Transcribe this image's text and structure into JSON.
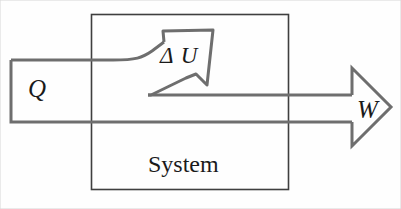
{
  "figure": {
    "kind": "thermodynamics-energy-flow-diagram",
    "width": 401,
    "height": 209,
    "background_color": "#fefefe"
  },
  "labels": {
    "heat_in": "Q",
    "internal_energy_change": "Δ U",
    "work_out": "W",
    "system_box": "System"
  },
  "colors": {
    "flow_stroke": "#6e6e6e",
    "box_stroke": "#3f3f3f",
    "text": "#1a1a1a",
    "background": "#fefefe"
  },
  "elements": {
    "system_box": {
      "name": "System",
      "x": 91,
      "y": 14,
      "width": 198,
      "height": 176,
      "stroke_width": 1.6
    },
    "heat_arrow": {
      "label": "Q",
      "direction": "into-system",
      "band_left_x": 10,
      "band_top_y": 60,
      "band_bottom_y": 122,
      "stroke_width": 3
    },
    "internal_energy_arrow": {
      "label": "Δ U",
      "direction": "up-right",
      "tip_x": 213,
      "tip_y": 30,
      "base_y": 95,
      "stroke_width": 3
    },
    "work_arrow": {
      "label": "W",
      "direction": "out-of-system",
      "shaft_top_y": 95,
      "shaft_bottom_y": 122,
      "head_tip_x": 391,
      "head_top_y": 68,
      "head_bottom_y": 146,
      "stroke_width": 3
    }
  }
}
